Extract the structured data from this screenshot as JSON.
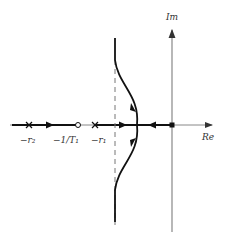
{
  "diagram": {
    "type": "root-locus",
    "axes": {
      "real_label": "Re",
      "imag_label": "Im"
    },
    "points": [
      {
        "label": "−r₂",
        "marker": "pole-cross"
      },
      {
        "label": "−1/T₁",
        "marker": "zero-circle"
      },
      {
        "label": "−r₁",
        "marker": "pole-cross"
      },
      {
        "label": "",
        "marker": "pole-square"
      }
    ],
    "asymptote": "dashed vertical line",
    "colors": {
      "locus": "#111111",
      "axis": "#888888",
      "text": "#333333"
    }
  }
}
